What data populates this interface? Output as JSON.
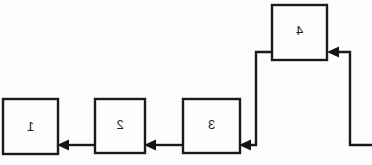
{
  "diagram": {
    "orientation": "mirrored-horizontal",
    "background_color": "#fdfdfd",
    "line_color": "#1a1a1a",
    "text_color": "#1c1c1c",
    "width": 372,
    "height": 165,
    "nodes": [
      {
        "id": "node-1",
        "label": "1",
        "x": 3,
        "y": 99,
        "w": 55,
        "h": 55
      },
      {
        "id": "node-2",
        "label": "2",
        "x": 95,
        "y": 99,
        "w": 50,
        "h": 54
      },
      {
        "id": "node-3",
        "label": "3",
        "x": 183,
        "y": 99,
        "w": 57,
        "h": 54
      },
      {
        "id": "node-4",
        "label": "4",
        "x": 272,
        "y": 5,
        "w": 55,
        "h": 55
      }
    ],
    "edges": [
      {
        "id": "edge-2-to-1",
        "from": "node-2",
        "to": "node-1",
        "direction": "left"
      },
      {
        "id": "edge-3-to-2",
        "from": "node-3",
        "to": "node-2",
        "direction": "left"
      },
      {
        "id": "edge-4-to-3",
        "from": "node-4",
        "to": "node-3",
        "direction": "down-left"
      },
      {
        "id": "edge-in-to-4",
        "from": "entry",
        "to": "node-4",
        "direction": "up-left"
      }
    ]
  }
}
